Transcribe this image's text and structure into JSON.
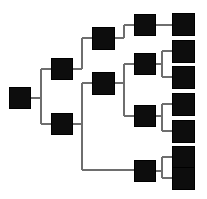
{
  "diagram": {
    "canvas": {
      "width": 207,
      "height": 199,
      "background": "#ffffff"
    },
    "style": {
      "node_fill": "#0d0d0d",
      "node_stroke": "#000000",
      "link_color": "#6e6e6e",
      "link_width": 2,
      "node_size": 21
    },
    "nodes": [
      {
        "id": "n0",
        "label": "root-node",
        "level": 1,
        "x": 9,
        "y": 87,
        "size": 21
      },
      {
        "id": "n1",
        "label": "level2-node-upper",
        "level": 2,
        "x": 51,
        "y": 58,
        "size": 21
      },
      {
        "id": "n2",
        "label": "level2-node-lower",
        "level": 2,
        "x": 51,
        "y": 113,
        "size": 21
      },
      {
        "id": "n3",
        "label": "level3-node-upper",
        "level": 3,
        "x": 92,
        "y": 27,
        "size": 22
      },
      {
        "id": "n4",
        "label": "level3-node-lower",
        "level": 3,
        "x": 92,
        "y": 72,
        "size": 22
      },
      {
        "id": "n5",
        "label": "level4-node-1",
        "level": 4,
        "x": 134,
        "y": 14,
        "size": 21
      },
      {
        "id": "n6",
        "label": "level4-node-2",
        "level": 4,
        "x": 134,
        "y": 53,
        "size": 21
      },
      {
        "id": "n7",
        "label": "level4-node-3",
        "level": 4,
        "x": 134,
        "y": 105,
        "size": 21
      },
      {
        "id": "n8",
        "label": "level4-node-4",
        "level": 4,
        "x": 134,
        "y": 160,
        "size": 21
      },
      {
        "id": "l1",
        "label": "leaf-node-1",
        "level": 5,
        "x": 172,
        "y": 13,
        "size": 22
      },
      {
        "id": "l2",
        "label": "leaf-node-2",
        "level": 5,
        "x": 172,
        "y": 40,
        "size": 22
      },
      {
        "id": "l3",
        "label": "leaf-node-3",
        "level": 5,
        "x": 172,
        "y": 66,
        "size": 22
      },
      {
        "id": "l4",
        "label": "leaf-node-4",
        "level": 5,
        "x": 172,
        "y": 93,
        "size": 22
      },
      {
        "id": "l5",
        "label": "leaf-node-5",
        "level": 5,
        "x": 172,
        "y": 120,
        "size": 22
      },
      {
        "id": "l6",
        "label": "leaf-node-6",
        "level": 5,
        "x": 172,
        "y": 146,
        "size": 22
      },
      {
        "id": "l7",
        "label": "leaf-node-7",
        "level": 5,
        "x": 172,
        "y": 167,
        "size": 22
      }
    ],
    "links": [
      {
        "id": "e0",
        "label": "root-to-level2-split",
        "d": "M 30 97.5 L 41 97.5 M 41 68.5 L 41 123.5 M 41 68.5 L 51 68.5 M 41 123.5 L 51 123.5"
      },
      {
        "id": "e1",
        "label": "level2upper-to-level3",
        "d": "M 72 68.5 L 82 68.5 M 82 38 L 82 68.5 M 82 38 L 92 38"
      },
      {
        "id": "e2",
        "label": "level2lower-to-branch",
        "d": "M 72 123.5 L 82 123.5 M 82 83 L 82 170 M 82 83 L 92 83 M 82 170 L 134 170"
      },
      {
        "id": "e3",
        "label": "level3upper-to-level4",
        "d": "M 114 38 L 124 38 M 124 24.5 L 124 38 M 124 24.5 L 134 24.5"
      },
      {
        "id": "e4",
        "label": "level3lower-to-level4",
        "d": "M 114 83 L 124 83 M 124 63.5 L 124 115.5 M 124 63.5 L 134 63.5 M 124 115.5 L 134 115.5"
      },
      {
        "id": "e5",
        "label": "level4node1-to-leaf1",
        "d": "M 155 24.5 L 172 24.5"
      },
      {
        "id": "e6",
        "label": "level4node2-to-leaves",
        "d": "M 155 63.5 L 162 63.5 M 162 51 L 162 77 M 162 51 L 172 51 M 162 77 L 172 77"
      },
      {
        "id": "e7",
        "label": "level4node3-to-leaves",
        "d": "M 155 115.5 L 162 115.5 M 162 104 L 162 131 M 162 104 L 172 104 M 162 131 L 172 131"
      },
      {
        "id": "e8",
        "label": "level4node4-to-leaves",
        "d": "M 155 170.5 L 162 170.5 M 162 157 L 162 178 M 162 157 L 172 157 M 162 178 L 172 178"
      }
    ]
  }
}
